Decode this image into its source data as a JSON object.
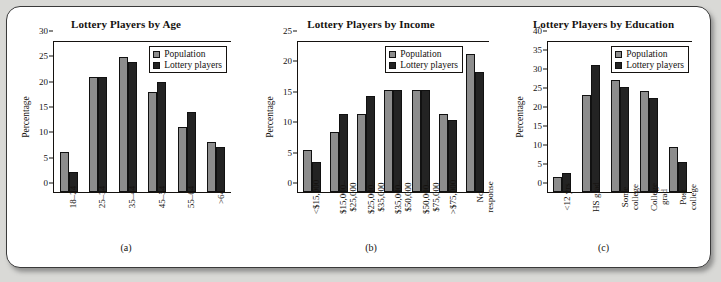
{
  "figure": {
    "legend": {
      "series": [
        "Population",
        "Lottery players"
      ]
    },
    "colors": {
      "population": "#8d8d8d",
      "lottery_players": "#232323",
      "frame": "#3a3a3a",
      "page_background": "#d9d9d6",
      "panel_background": "#ffffff"
    },
    "captions": [
      "(a)",
      "(b)",
      "(c)"
    ]
  },
  "chart_data": [
    {
      "type": "bar",
      "title": "Lottery Players by Age",
      "caption": "(a)",
      "xlabel": "",
      "ylabel": "Percentage",
      "ylim": [
        0,
        30
      ],
      "yticks": [
        0,
        5,
        10,
        15,
        20,
        25,
        30
      ],
      "grid": false,
      "legend_position": "top-right",
      "categories": [
        "18–24",
        "25–34",
        "35–44",
        "45–54",
        "55–64",
        ">64"
      ],
      "series": [
        {
          "name": "Population",
          "values": [
            8,
            23,
            27,
            20,
            13,
            10
          ]
        },
        {
          "name": "Lottery players",
          "values": [
            4,
            23,
            26,
            22,
            16,
            9
          ]
        }
      ]
    },
    {
      "type": "bar",
      "title": "Lottery Players by Income",
      "caption": "(b)",
      "xlabel": "",
      "ylabel": "Percentage",
      "ylim": [
        0,
        25
      ],
      "yticks": [
        0,
        5,
        10,
        15,
        20,
        25
      ],
      "grid": false,
      "legend_position": "top-right",
      "categories": [
        "<$15,000",
        "$15,000–\n$25,000",
        "$25,000–\n$35,000",
        "$35,000–\n$50,000",
        "$50,000–\n$75,000",
        ">$75,000",
        "No\nresponse"
      ],
      "series": [
        {
          "name": "Population",
          "values": [
            7,
            10,
            13,
            17,
            17,
            13,
            23
          ]
        },
        {
          "name": "Lottery players",
          "values": [
            5,
            13,
            16,
            17,
            17,
            12,
            20
          ]
        }
      ]
    },
    {
      "type": "bar",
      "title": "Lottery Players by Education",
      "caption": "(c)",
      "xlabel": "",
      "ylabel": "Percentage",
      "ylim": [
        0,
        40
      ],
      "yticks": [
        0,
        5,
        10,
        15,
        20,
        25,
        30,
        35,
        40
      ],
      "grid": false,
      "legend_position": "top-right",
      "categories": [
        "<12 yrs",
        "HS grad",
        "Some\ncollege",
        "College\ngrad",
        "Post\ncollege"
      ],
      "series": [
        {
          "name": "Population",
          "values": [
            4,
            26,
            30,
            27,
            12
          ]
        },
        {
          "name": "Lottery players",
          "values": [
            5,
            34,
            28,
            25,
            8
          ]
        }
      ]
    }
  ]
}
